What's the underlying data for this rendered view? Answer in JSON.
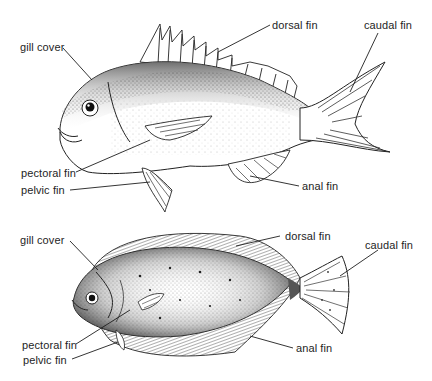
{
  "diagram": {
    "type": "labeled-illustration",
    "figures": [
      {
        "id": "round-fish",
        "description": "Sea bream-like round fish in lateral view",
        "labels": {
          "gill_cover": "gill cover",
          "dorsal_fin": "dorsal fin",
          "caudal_fin": "caudal fin",
          "pectoral_fin": "pectoral fin",
          "pelvic_fin": "pelvic fin",
          "anal_fin": "anal fin"
        }
      },
      {
        "id": "flat-fish",
        "description": "Flatfish (flounder-like) viewed from eyed side",
        "labels": {
          "gill_cover": "gill cover",
          "dorsal_fin": "dorsal fin",
          "caudal_fin": "caudal fin",
          "pectoral_fin": "pectoral fin",
          "pelvic_fin": "pelvic fin",
          "anal_fin": "anal fin"
        }
      }
    ],
    "colors": {
      "ink": "#1e1e1e",
      "background": "#ffffff",
      "shade": "#6a6a6a"
    }
  }
}
